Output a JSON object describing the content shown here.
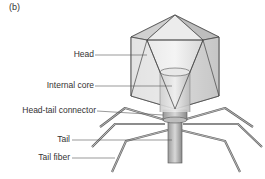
{
  "panel_label": "(b)",
  "labels": [
    {
      "id": "head",
      "text": "Head"
    },
    {
      "id": "internal-core",
      "text": "Internal core"
    },
    {
      "id": "head-tail-connector",
      "text": "Head-tail connector"
    },
    {
      "id": "tail",
      "text": "Tail"
    },
    {
      "id": "tail-fiber",
      "text": "Tail fiber"
    }
  ],
  "colors": {
    "line": "#555555",
    "face_light": "#eeeeee",
    "face_mid": "#d6d6d6",
    "face_dark": "#bdbdbd",
    "fiber": "#777777"
  }
}
